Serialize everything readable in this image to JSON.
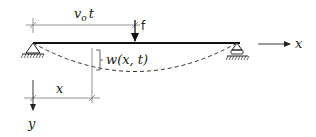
{
  "diagram": {
    "labels": {
      "load_position": "v₀t",
      "load_position_base": "v",
      "load_position_sub": "o",
      "load_position_t": "t",
      "force": "f",
      "deflection": "w(x, t)",
      "x_position": "x",
      "x_axis": "x",
      "y_axis": "y"
    },
    "elements": [
      {
        "id": "beam",
        "type": "line",
        "description": "horizontal beam"
      },
      {
        "id": "left-support",
        "type": "pinned-support"
      },
      {
        "id": "right-support",
        "type": "roller-support"
      },
      {
        "id": "deflected-shape",
        "type": "dashed-curve"
      },
      {
        "id": "load-arrow",
        "type": "arrow-down",
        "label": "f"
      },
      {
        "id": "load-dimension",
        "type": "dimension-line",
        "label": "v₀t"
      },
      {
        "id": "x-dimension",
        "type": "dimension-line",
        "label": "x"
      },
      {
        "id": "deflection-bracket",
        "type": "bracket",
        "label": "w(x, t)"
      },
      {
        "id": "x-axis-arrow",
        "type": "arrow-right",
        "label": "x"
      },
      {
        "id": "y-axis-arrow",
        "type": "arrow-down",
        "label": "y"
      }
    ],
    "colors": {
      "stroke": "#222222",
      "thin_stroke": "#777777",
      "background": "#ffffff"
    }
  }
}
